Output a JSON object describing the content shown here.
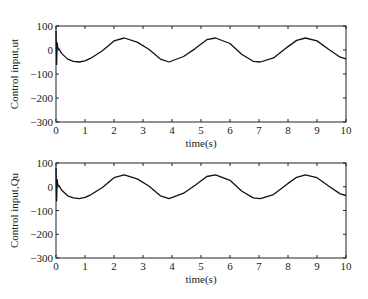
{
  "chart_data": [
    {
      "type": "line",
      "title": "",
      "xlabel": "time(s)",
      "ylabel": "Control input,ut",
      "xlim": [
        0,
        10
      ],
      "ylim": [
        -300,
        100
      ],
      "xticks": [
        0,
        1,
        2,
        3,
        4,
        5,
        6,
        7,
        8,
        9,
        10
      ],
      "yticks": [
        -300,
        -200,
        -100,
        0,
        100
      ],
      "xtick_labels": [
        "0",
        "1",
        "2",
        "3",
        "4",
        "5",
        "6",
        "7",
        "8",
        "9",
        "10"
      ],
      "ytick_labels": [
        "-300",
        "-200",
        "-100",
        "0",
        "100"
      ],
      "grid": false,
      "series": [
        {
          "name": "ut",
          "color": "#111111",
          "x": [
            0,
            0.02,
            0.04,
            0.06,
            0.1,
            0.2,
            0.4,
            0.6,
            0.8,
            1.0,
            1.2,
            1.6,
            2.0,
            2.35,
            2.8,
            3.2,
            3.6,
            3.9,
            4.4,
            4.8,
            5.2,
            5.5,
            6.0,
            6.4,
            6.8,
            7.05,
            7.5,
            8.0,
            8.3,
            8.6,
            9.0,
            9.4,
            9.8,
            10.0
          ],
          "y": [
            80,
            -60,
            30,
            10,
            5,
            -15,
            -38,
            -47,
            -50,
            -45,
            -34,
            -3,
            38,
            50,
            33,
            3,
            -38,
            -50,
            -27,
            6,
            43,
            50,
            27,
            -18,
            -47,
            -50,
            -33,
            14,
            40,
            50,
            38,
            3,
            -30,
            -37
          ]
        }
      ]
    },
    {
      "type": "line",
      "title": "",
      "xlabel": "time(s)",
      "ylabel": "Control input,Qu",
      "xlim": [
        0,
        10
      ],
      "ylim": [
        -300,
        100
      ],
      "xticks": [
        0,
        1,
        2,
        3,
        4,
        5,
        6,
        7,
        8,
        9,
        10
      ],
      "yticks": [
        -300,
        -200,
        -100,
        0,
        100
      ],
      "xtick_labels": [
        "0",
        "1",
        "2",
        "3",
        "4",
        "5",
        "6",
        "7",
        "8",
        "9",
        "10"
      ],
      "ytick_labels": [
        "-300",
        "-200",
        "-100",
        "0",
        "100"
      ],
      "grid": false,
      "series": [
        {
          "name": "Qu",
          "color": "#111111",
          "x": [
            0,
            0.02,
            0.04,
            0.06,
            0.1,
            0.2,
            0.4,
            0.6,
            0.8,
            1.0,
            1.2,
            1.6,
            2.0,
            2.35,
            2.8,
            3.2,
            3.6,
            3.9,
            4.4,
            4.8,
            5.2,
            5.5,
            6.0,
            6.4,
            6.8,
            7.05,
            7.5,
            8.0,
            8.3,
            8.6,
            9.0,
            9.4,
            9.8,
            10.0
          ],
          "y": [
            80,
            -60,
            30,
            10,
            5,
            -15,
            -38,
            -47,
            -50,
            -45,
            -34,
            -3,
            38,
            50,
            33,
            3,
            -38,
            -50,
            -27,
            6,
            43,
            50,
            27,
            -18,
            -47,
            -50,
            -33,
            14,
            40,
            50,
            38,
            3,
            -30,
            -37
          ]
        }
      ]
    }
  ],
  "plots": {
    "top": {
      "ylabel": "Control input,ut",
      "xlabel": "time(s)"
    },
    "bottom": {
      "ylabel": "Control input,Qu",
      "xlabel": "time(s)"
    }
  }
}
